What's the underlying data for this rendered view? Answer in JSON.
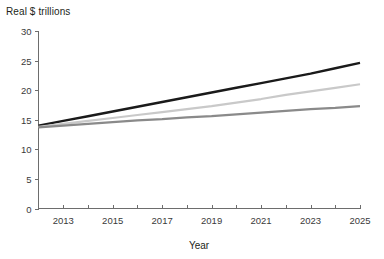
{
  "chart_data": {
    "type": "line",
    "title": "",
    "ylabel": "Real $ trillions",
    "xlabel": "Year",
    "ylim": [
      0,
      30
    ],
    "xlim": [
      2012,
      2025
    ],
    "yticks": [
      0,
      5,
      10,
      15,
      20,
      25,
      30
    ],
    "ytick_labels": [
      "0",
      "5",
      "10",
      "15",
      "20",
      "25",
      "30"
    ],
    "xticks": [
      2013,
      2015,
      2017,
      2019,
      2021,
      2023,
      2025
    ],
    "xtick_labels": [
      "2013",
      "2015",
      "2017",
      "2019",
      "2021",
      "2023",
      "2025"
    ],
    "xminor_ticks": [
      2012,
      2013,
      2014,
      2015,
      2016,
      2017,
      2018,
      2019,
      2020,
      2021,
      2022,
      2023,
      2024,
      2025
    ],
    "grid": false,
    "legend": "none",
    "x": [
      2012,
      2013,
      2014,
      2015,
      2016,
      2017,
      2018,
      2019,
      2020,
      2021,
      2022,
      2023,
      2024,
      2025
    ],
    "series": [
      {
        "name": "high-growth",
        "color": "#1a1a1a",
        "linewidth": 2.4,
        "values": [
          14.0,
          14.8,
          15.6,
          16.4,
          17.2,
          18.0,
          18.8,
          19.6,
          20.4,
          21.2,
          22.0,
          22.8,
          23.7,
          24.6
        ]
      },
      {
        "name": "mid-growth",
        "color": "#c9c9c9",
        "linewidth": 2.2,
        "values": [
          13.8,
          14.3,
          14.8,
          15.3,
          15.8,
          16.3,
          16.8,
          17.3,
          17.9,
          18.5,
          19.2,
          19.8,
          20.4,
          21.0
        ]
      },
      {
        "name": "low-growth",
        "color": "#8a8a8a",
        "linewidth": 2.2,
        "values": [
          13.7,
          14.0,
          14.3,
          14.6,
          14.9,
          15.1,
          15.4,
          15.6,
          15.9,
          16.2,
          16.5,
          16.8,
          17.0,
          17.3
        ]
      }
    ],
    "colors": {
      "axis": "#6d6d6d",
      "text": "#231f20",
      "series_black": "#1a1a1a",
      "series_light_gray": "#c9c9c9",
      "series_gray": "#8a8a8a",
      "background": "#ffffff"
    }
  }
}
